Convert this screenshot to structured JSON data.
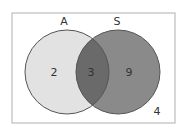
{
  "diagram": {
    "type": "venn",
    "sets": [
      {
        "label": "A",
        "only_count": "2",
        "fill": "#e2e2e2"
      },
      {
        "label": "S",
        "only_count": "9",
        "fill": "#8a8a8a"
      }
    ],
    "intersection": {
      "count": "3",
      "fill": "#6a6a6a"
    },
    "outside": {
      "count": "4"
    },
    "colors": {
      "border": "#bdbdbd",
      "circle_stroke": "#555555",
      "text": "#333333"
    }
  }
}
